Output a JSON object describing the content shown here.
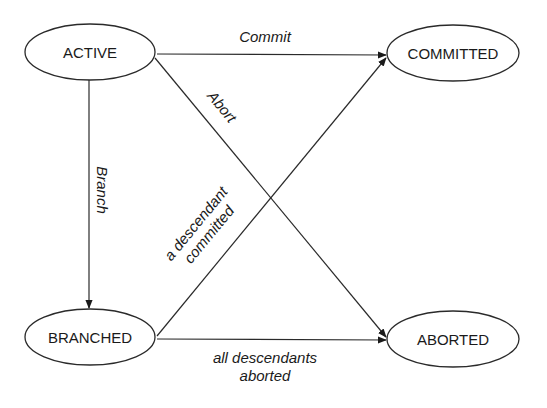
{
  "diagram": {
    "type": "state-transition",
    "nodes": {
      "active": {
        "label": "ACTIVE"
      },
      "committed": {
        "label": "COMMITTED"
      },
      "branched": {
        "label": "BRANCHED"
      },
      "aborted": {
        "label": "ABORTED"
      }
    },
    "edges": {
      "commit": {
        "from": "ACTIVE",
        "to": "COMMITTED",
        "label": "Commit"
      },
      "abort": {
        "from": "ACTIVE",
        "to": "ABORTED",
        "label": "Abort"
      },
      "branch": {
        "from": "ACTIVE",
        "to": "BRANCHED",
        "label": "Branch"
      },
      "descendant_committed": {
        "from": "BRANCHED",
        "to": "COMMITTED",
        "label_line1": "a descendant",
        "label_line2": "committed"
      },
      "descendants_aborted": {
        "from": "BRANCHED",
        "to": "ABORTED",
        "label_line1": "all descendants",
        "label_line2": "aborted"
      }
    }
  }
}
